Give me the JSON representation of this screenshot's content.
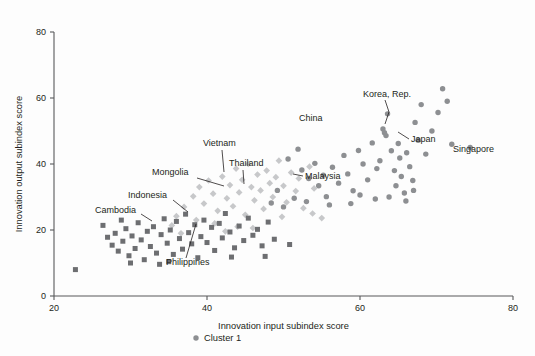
{
  "chart_data": {
    "type": "scatter",
    "title": "",
    "xlabel": "Innovation input subindex score",
    "ylabel": "Innovation output subindex score",
    "xlim": [
      20,
      80
    ],
    "ylim": [
      0,
      80
    ],
    "xticks": [
      20,
      40,
      60,
      80
    ],
    "yticks": [
      0,
      20,
      40,
      60,
      80
    ],
    "grid": false,
    "legend_position": "bottom-center",
    "legend": [
      {
        "name": "Cluster 1",
        "marker": "circle",
        "color": "#8d8f92"
      },
      {
        "name": "Cluster 2",
        "marker": "diamond",
        "color": "#c7c8ca"
      },
      {
        "name": "Cluster 3",
        "marker": "square",
        "color": "#6d6e71"
      }
    ],
    "series": [
      {
        "name": "Cluster 1",
        "marker": "circle",
        "color": "#8d8f92",
        "points": [
          [
            50.6,
            41.5
          ],
          [
            51.9,
            44.5
          ],
          [
            52.4,
            38.2
          ],
          [
            53.3,
            35.6
          ],
          [
            54.1,
            40.2
          ],
          [
            54.6,
            33.4
          ],
          [
            55.2,
            36.6
          ],
          [
            55.6,
            30.1
          ],
          [
            56.4,
            39.0
          ],
          [
            57.2,
            34.2
          ],
          [
            57.9,
            42.6
          ],
          [
            58.4,
            37.0
          ],
          [
            59.1,
            31.9
          ],
          [
            59.8,
            44.1
          ],
          [
            60.4,
            40.0
          ],
          [
            61.0,
            35.2
          ],
          [
            61.6,
            46.4
          ],
          [
            62.2,
            38.6
          ],
          [
            62.6,
            41.0
          ],
          [
            63.0,
            50.6
          ],
          [
            63.2,
            49.5
          ],
          [
            63.4,
            48.6
          ],
          [
            63.6,
            55.2
          ],
          [
            64.1,
            44.0
          ],
          [
            64.5,
            38.0
          ],
          [
            64.7,
            33.4
          ],
          [
            65.0,
            46.2
          ],
          [
            65.2,
            41.8
          ],
          [
            65.4,
            36.2
          ],
          [
            65.8,
            31.2
          ],
          [
            66.1,
            43.4
          ],
          [
            66.5,
            39.2
          ],
          [
            66.9,
            35.0
          ],
          [
            67.2,
            52.6
          ],
          [
            67.6,
            47.2
          ],
          [
            68.0,
            58.0
          ],
          [
            68.6,
            43.0
          ],
          [
            69.4,
            50.0
          ],
          [
            70.2,
            55.6
          ],
          [
            70.8,
            62.8
          ],
          [
            71.4,
            59.0
          ],
          [
            72.0,
            46.0
          ],
          [
            74.4,
            45.0
          ],
          [
            49.2,
            32.0
          ],
          [
            48.4,
            28.2
          ],
          [
            50.0,
            27.0
          ],
          [
            51.4,
            29.6
          ],
          [
            53.0,
            28.6
          ],
          [
            56.0,
            27.6
          ],
          [
            58.8,
            28.0
          ],
          [
            60.0,
            30.6
          ],
          [
            62.0,
            29.4
          ],
          [
            63.8,
            30.0
          ],
          [
            66.0,
            28.8
          ],
          [
            67.0,
            32.0
          ]
        ]
      },
      {
        "name": "Cluster 2",
        "marker": "diamond",
        "color": "#c7c8ca",
        "points": [
          [
            37.0,
            27.0
          ],
          [
            38.2,
            30.2
          ],
          [
            39.0,
            33.0
          ],
          [
            39.6,
            28.0
          ],
          [
            40.2,
            35.0
          ],
          [
            40.8,
            31.0
          ],
          [
            41.4,
            25.8
          ],
          [
            42.0,
            36.2
          ],
          [
            42.6,
            29.6
          ],
          [
            43.0,
            33.6
          ],
          [
            43.4,
            27.2
          ],
          [
            43.8,
            38.6
          ],
          [
            44.2,
            31.4
          ],
          [
            44.6,
            35.2
          ],
          [
            45.0,
            24.6
          ],
          [
            45.4,
            40.0
          ],
          [
            45.8,
            33.0
          ],
          [
            46.2,
            29.0
          ],
          [
            46.6,
            36.8
          ],
          [
            47.0,
            32.0
          ],
          [
            47.4,
            26.4
          ],
          [
            47.8,
            38.0
          ],
          [
            48.2,
            34.2
          ],
          [
            48.6,
            30.0
          ],
          [
            49.0,
            36.0
          ],
          [
            49.4,
            41.0
          ],
          [
            50.0,
            33.4
          ],
          [
            50.4,
            28.4
          ],
          [
            51.0,
            37.4
          ],
          [
            51.6,
            31.8
          ],
          [
            52.0,
            35.6
          ],
          [
            52.6,
            26.6
          ],
          [
            53.4,
            39.2
          ],
          [
            54.0,
            32.6
          ],
          [
            36.0,
            24.2
          ],
          [
            35.4,
            21.4
          ],
          [
            38.6,
            23.0
          ],
          [
            41.0,
            22.0
          ],
          [
            44.0,
            21.0
          ],
          [
            42.4,
            19.6
          ],
          [
            49.8,
            24.0
          ],
          [
            53.8,
            25.0
          ],
          [
            55.0,
            23.6
          ],
          [
            46.0,
            20.6
          ],
          [
            36.6,
            19.0
          ]
        ]
      },
      {
        "name": "Cluster 3",
        "marker": "square",
        "color": "#6d6e71",
        "points": [
          [
            22.8,
            8.0
          ],
          [
            27.0,
            17.8
          ],
          [
            27.6,
            15.4
          ],
          [
            28.0,
            19.0
          ],
          [
            28.4,
            13.6
          ],
          [
            29.0,
            16.6
          ],
          [
            29.4,
            20.4
          ],
          [
            29.8,
            12.2
          ],
          [
            30.2,
            18.2
          ],
          [
            30.6,
            14.4
          ],
          [
            31.0,
            22.2
          ],
          [
            31.4,
            17.0
          ],
          [
            31.8,
            11.0
          ],
          [
            32.2,
            19.6
          ],
          [
            32.6,
            15.0
          ],
          [
            33.0,
            21.0
          ],
          [
            33.4,
            13.0
          ],
          [
            34.0,
            18.6
          ],
          [
            34.4,
            23.4
          ],
          [
            34.8,
            16.0
          ],
          [
            35.2,
            20.0
          ],
          [
            35.6,
            12.6
          ],
          [
            36.0,
            22.6
          ],
          [
            36.4,
            17.4
          ],
          [
            36.8,
            14.2
          ],
          [
            37.2,
            24.8
          ],
          [
            37.6,
            19.2
          ],
          [
            38.0,
            15.8
          ],
          [
            38.4,
            21.6
          ],
          [
            38.8,
            11.6
          ],
          [
            39.2,
            18.0
          ],
          [
            39.6,
            23.0
          ],
          [
            40.0,
            16.2
          ],
          [
            40.6,
            20.8
          ],
          [
            41.0,
            13.8
          ],
          [
            41.6,
            22.0
          ],
          [
            42.0,
            17.6
          ],
          [
            42.4,
            25.0
          ],
          [
            43.0,
            19.4
          ],
          [
            43.6,
            14.6
          ],
          [
            44.2,
            21.2
          ],
          [
            44.8,
            16.8
          ],
          [
            45.4,
            23.6
          ],
          [
            46.0,
            18.4
          ],
          [
            46.6,
            20.2
          ],
          [
            47.2,
            15.2
          ],
          [
            48.0,
            22.4
          ],
          [
            48.8,
            17.2
          ],
          [
            30.0,
            10.0
          ],
          [
            33.8,
            9.6
          ],
          [
            26.4,
            21.4
          ],
          [
            28.8,
            23.0
          ],
          [
            35.0,
            10.4
          ],
          [
            43.2,
            11.8
          ],
          [
            47.6,
            12.0
          ],
          [
            50.8,
            15.6
          ]
        ]
      }
    ],
    "annotations": [
      {
        "label": "Korea, Rep.",
        "text_x": 363,
        "text_y": 97,
        "leader": "M 385 100 L 389 112 L 385 124",
        "anchor": "start"
      },
      {
        "label": "Japan",
        "text_x": 411,
        "text_y": 142,
        "leader": "M 409 139 L 398 132",
        "anchor": "start"
      },
      {
        "label": "Singapore",
        "text_x": 453,
        "text_y": 152,
        "leader": "",
        "anchor": "start"
      },
      {
        "label": "China",
        "text_x": 299,
        "text_y": 121,
        "leader": "",
        "anchor": "start"
      },
      {
        "label": "Vietnam",
        "text_x": 203,
        "text_y": 146,
        "leader": "M 222 150 L 224 172",
        "anchor": "start"
      },
      {
        "label": "Thailand",
        "text_x": 229,
        "text_y": 166,
        "leader": "M 243 170 L 244 184",
        "anchor": "start"
      },
      {
        "label": "Malaysia",
        "text_x": 305,
        "text_y": 179,
        "leader": "M 303 176 L 293 174",
        "anchor": "start"
      },
      {
        "label": "Mongolia",
        "text_x": 152,
        "text_y": 175,
        "leader": "M 197 178 L 224 186",
        "anchor": "start"
      },
      {
        "label": "Indonesia",
        "text_x": 128,
        "text_y": 198,
        "leader": "M 173 200 L 188 212",
        "anchor": "start"
      },
      {
        "label": "Cambodia",
        "text_x": 95,
        "text_y": 213,
        "leader": "M 141 214 L 152 221",
        "anchor": "start"
      },
      {
        "label": "Philippines",
        "text_x": 166,
        "text_y": 265,
        "leader": "M 186 258 L 196 224",
        "anchor": "start"
      }
    ]
  },
  "axes": {
    "x_title": "Innovation input subindex score",
    "y_title": "Innovation output subindex score",
    "x_tick_labels": [
      "20",
      "40",
      "60",
      "80"
    ],
    "y_tick_labels": [
      "0",
      "20",
      "40",
      "60",
      "80"
    ]
  },
  "legend_items": [
    {
      "label": "Cluster 1"
    },
    {
      "label": "Cluster 2"
    },
    {
      "label": "Cluster 3"
    }
  ]
}
